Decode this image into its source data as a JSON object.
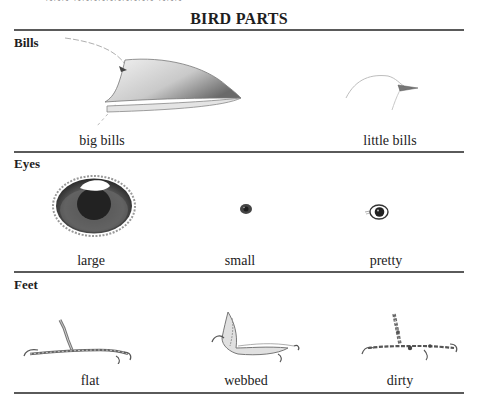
{
  "page": {
    "cut_off_header": "~~~ ~~~~~~~~~~ ~~~",
    "title": "BIRD PARTS"
  },
  "sections": [
    {
      "label": "Bills",
      "items": [
        {
          "caption": "big bills",
          "illustration": "large-bird-bill"
        },
        {
          "caption": "little bills",
          "illustration": "small-bird-bill"
        }
      ]
    },
    {
      "label": "Eyes",
      "items": [
        {
          "caption": "large",
          "illustration": "large-bird-eye"
        },
        {
          "caption": "small",
          "illustration": "small-bird-eye"
        },
        {
          "caption": "pretty",
          "illustration": "pretty-bird-eye"
        }
      ]
    },
    {
      "label": "Feet",
      "items": [
        {
          "caption": "flat",
          "illustration": "flat-bird-foot"
        },
        {
          "caption": "webbed",
          "illustration": "webbed-bird-foot"
        },
        {
          "caption": "dirty",
          "illustration": "dirty-bird-foot"
        }
      ]
    }
  ]
}
